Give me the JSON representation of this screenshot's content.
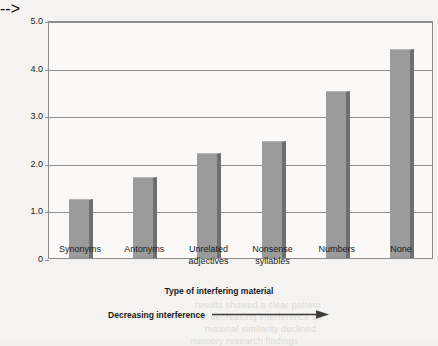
{
  "chart_data": {
    "type": "bar",
    "title": "",
    "xlabel": "Type of interfering material",
    "ylabel": "Mean number of test items recalled",
    "categories": [
      "Synonyms",
      "Antonyms",
      "Unrelated adjectives",
      "Nonsense syllables",
      "Numbers",
      "None"
    ],
    "category_lines": [
      [
        "Synonyms"
      ],
      [
        "Antonyms"
      ],
      [
        "Unrelated",
        "adjectives"
      ],
      [
        "Nonsense",
        "syllables"
      ],
      [
        "Numbers"
      ],
      [
        "None"
      ]
    ],
    "values": [
      1.25,
      1.7,
      2.2,
      2.45,
      3.5,
      4.4
    ],
    "ylim": [
      0,
      5
    ],
    "yticks": [
      0,
      1,
      2,
      3,
      4,
      5
    ],
    "ytick_labels": [
      "0",
      "1.0",
      "2.0",
      "3.0",
      "4.0",
      "5.0"
    ],
    "grid": true,
    "legend": null,
    "annotations": [
      {
        "text": "Decreasing interference",
        "arrow": "right"
      }
    ],
    "colors": {
      "bar_fill": "#9b9b9b",
      "bar_shadow": "#6f6f6f",
      "bar_highlight": "#b4b4b4",
      "plot_background": "#faf9f8",
      "page_background": "#f4f3f1",
      "axis": "#8d8d8d",
      "text": "#1a1a1a"
    }
  },
  "bleed_text": [
    {
      "text": "learning",
      "x": 200,
      "y": 28
    },
    {
      "text": "recalled some material and others",
      "x": 150,
      "y": 40
    },
    {
      "text": "remembered almost nothing of what",
      "x": 145,
      "y": 52
    },
    {
      "text": "interference, similar material was",
      "x": 170,
      "y": 82
    },
    {
      "text": "1925; based on Chenet al. (2001)",
      "x": 165,
      "y": 94
    },
    {
      "text": "Unrelated material",
      "x": 300,
      "y": 140
    },
    {
      "text": "some participants recalled a great",
      "x": 170,
      "y": 172
    },
    {
      "text": "deal more of the list than others",
      "x": 180,
      "y": 184
    },
    {
      "text": "syllables produced a moderate",
      "x": 185,
      "y": 222
    },
    {
      "text": "level of interference in the task",
      "x": 175,
      "y": 234
    },
    {
      "text": "results showed a clear pattern",
      "x": 195,
      "y": 300
    },
    {
      "text": "of decreasing interference as",
      "x": 200,
      "y": 312
    },
    {
      "text": "material similarity declined",
      "x": 205,
      "y": 324
    },
    {
      "text": "memory research findings",
      "x": 190,
      "y": 336
    }
  ]
}
